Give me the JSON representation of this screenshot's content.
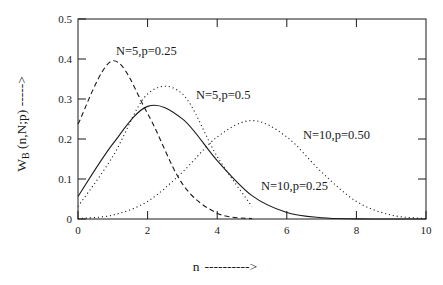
{
  "chart_data": {
    "type": "line",
    "title": "",
    "subtitle": "",
    "xlabel": "n ---------->",
    "ylabel": "W_B (n,N;p) ----->",
    "ylabel_main": "W",
    "ylabel_sub": "B",
    "ylabel_rest": " (n,N;p) ----->",
    "xlabel_symbol": "n",
    "xlabel_arrow": "---------->",
    "xlim": [
      0,
      10
    ],
    "ylim": [
      0,
      0.5
    ],
    "grid": false,
    "legend_position": "inline-annotations",
    "xticks": [
      0,
      2,
      4,
      6,
      8,
      10
    ],
    "xtick_labels": [
      "0",
      "2",
      "4",
      "6",
      "8",
      "10"
    ],
    "yticks": [
      0,
      0.1,
      0.2,
      0.3,
      0.4,
      0.5
    ],
    "ytick_labels": [
      "0",
      "0.1",
      "0.2",
      "0.3",
      "0.4",
      "0.5"
    ],
    "series": [
      {
        "name": "N=5,p=0.25",
        "style": "dashed",
        "N": 5,
        "p": 0.25,
        "x": [
          0,
          1,
          2,
          3,
          4,
          5
        ],
        "values": [
          0.2373,
          0.3955,
          0.2637,
          0.0879,
          0.0146,
          0.00098
        ],
        "peak_x": 1,
        "peak_y": 0.3955
      },
      {
        "name": "N=5,p=0.5",
        "style": "dotted",
        "N": 5,
        "p": 0.5,
        "x": [
          0,
          1,
          2,
          3,
          4,
          5
        ],
        "values": [
          0.03125,
          0.15625,
          0.3125,
          0.3125,
          0.15625,
          0.03125
        ],
        "peak_x": 2.5,
        "peak_y": 0.3413
      },
      {
        "name": "N=10,p=0.25",
        "style": "solid",
        "N": 10,
        "p": 0.25,
        "x": [
          0,
          1,
          2,
          3,
          4,
          5,
          6,
          7,
          8,
          9,
          10
        ],
        "values": [
          0.0563,
          0.1877,
          0.2816,
          0.2503,
          0.146,
          0.0584,
          0.0162,
          0.0031,
          0.0004,
          3e-05,
          1e-06
        ],
        "peak_x": 2.2,
        "peak_y": 0.2816
      },
      {
        "name": "N=10,p=0.50",
        "style": "dotted",
        "N": 10,
        "p": 0.5,
        "x": [
          0,
          1,
          2,
          3,
          4,
          5,
          6,
          7,
          8,
          9,
          10
        ],
        "values": [
          0.00098,
          0.0098,
          0.0439,
          0.1172,
          0.2051,
          0.2461,
          0.2051,
          0.1172,
          0.0439,
          0.0098,
          0.00098
        ],
        "peak_x": 5,
        "peak_y": 0.2461
      }
    ],
    "annotations": [
      {
        "text": "N=5,p=0.25",
        "x_px": 116,
        "y_px": 55
      },
      {
        "text": "N=5,p=0.5",
        "x_px": 196,
        "y_px": 99
      },
      {
        "text": "N=10,p=0.50",
        "x_px": 303,
        "y_px": 139
      },
      {
        "text": "N=10,p=0.25",
        "x_px": 261,
        "y_px": 190
      }
    ]
  },
  "colors": {
    "axis": "#1a1a1a",
    "curve": "#1a1a1a",
    "background": "#ffffff"
  }
}
